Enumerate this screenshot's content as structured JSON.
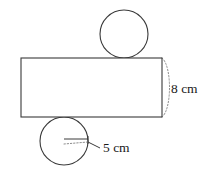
{
  "figure": {
    "name": "cylinder-net-diagram",
    "background_color": "#ffffff",
    "line_color": "#3a3a3a",
    "dotted_line_color": "#8d8d8d",
    "text_color": "#1a1a1a"
  },
  "shapes": {
    "rectangle": {
      "label": "lateral-face",
      "x": 21,
      "y": 58,
      "width": 141,
      "height": 59
    },
    "top_circle": {
      "label": "top-base",
      "cx": 124,
      "cy": 34,
      "r": 24
    },
    "bottom_circle": {
      "label": "bottom-base",
      "cx": 64,
      "cy": 141,
      "r": 24
    },
    "end_cap_arc": {
      "label": "cylinder-end-cap",
      "style": "dotted"
    },
    "radius_line": {
      "label": "radius-indicator",
      "style": "solid-with-dotted"
    }
  },
  "dimensions": {
    "height": {
      "value": "8",
      "unit": "cm",
      "text": "8 cm",
      "applies_to": "rectangle-height"
    },
    "radius": {
      "value": "5",
      "unit": "cm",
      "text": "5 cm",
      "applies_to": "circle-radius"
    }
  }
}
